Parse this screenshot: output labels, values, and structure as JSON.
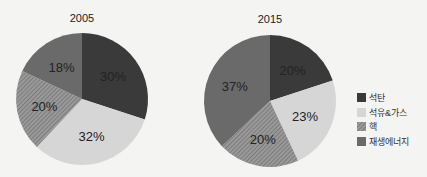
{
  "chart_data": [
    {
      "type": "pie",
      "title": "2005",
      "categories": [
        "석탄",
        "석유&가스",
        "핵",
        "재생에너지"
      ],
      "values": [
        30,
        32,
        20,
        18
      ],
      "labels": [
        "30%",
        "32%",
        "20%",
        "18%"
      ]
    },
    {
      "type": "pie",
      "title": "2015",
      "categories": [
        "석탄",
        "석유&가스",
        "핵",
        "재생에너지"
      ],
      "values": [
        20,
        23,
        20,
        37
      ],
      "labels": [
        "20%",
        "23%",
        "20%",
        "37%"
      ]
    }
  ],
  "legend": {
    "position": "right",
    "items": [
      {
        "label": "석탄",
        "color": "#3a3a3a"
      },
      {
        "label": "석유&가스",
        "color": "#d6d6d6"
      },
      {
        "label": "핵",
        "color": "#8a8a8a",
        "pattern": "hatch"
      },
      {
        "label": "재생에너지",
        "color": "#6a6a6a"
      }
    ]
  }
}
